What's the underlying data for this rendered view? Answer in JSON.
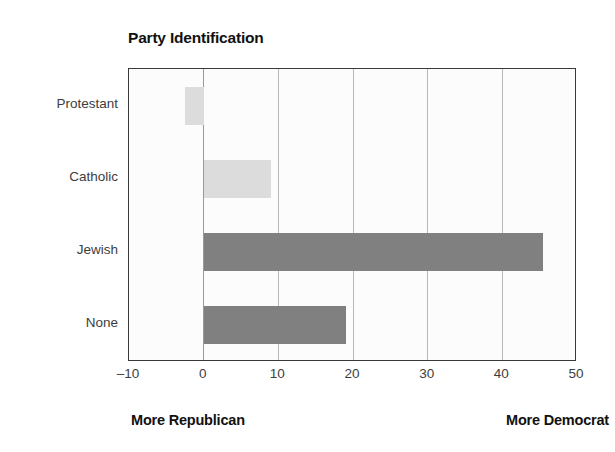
{
  "chart_data": {
    "type": "bar",
    "orientation": "horizontal",
    "title": "Party Identification",
    "xlabel": "",
    "ylabel": "",
    "categories": [
      "Protestant",
      "Catholic",
      "Jewish",
      "None"
    ],
    "values": [
      -2.5,
      9,
      45.5,
      19
    ],
    "xlim": [
      -10,
      50
    ],
    "xticks": [
      -10,
      0,
      10,
      20,
      30,
      40,
      50
    ],
    "xtick_labels": [
      "–10",
      "0",
      "10",
      "20",
      "30",
      "40",
      "50"
    ],
    "grid": "vertical-only",
    "legend": "none",
    "annotations": [
      {
        "text": "More Republican",
        "position": "bottom-left"
      },
      {
        "text": "More Democrat",
        "position": "bottom-right"
      }
    ],
    "bar_colors": [
      "#dcdcdc",
      "#dcdcdc",
      "#808080",
      "#808080"
    ],
    "colors": {
      "bar_light": "#dcdcdc",
      "bar_dark": "#808080",
      "plot_background": "#fcfcfc",
      "gridline": "#b9b9b9",
      "frame": "#3a3a3a",
      "text": "#3d3d3d",
      "title_text": "#111111"
    }
  }
}
